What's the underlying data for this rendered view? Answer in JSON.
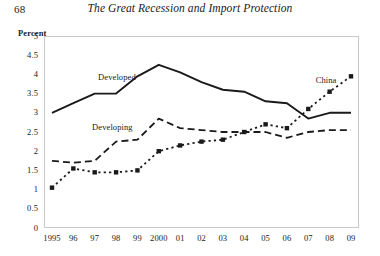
{
  "running_head": {
    "page_number": "68",
    "book_title": "The Great Recession and Import Protection"
  },
  "labels": {
    "developed": "Developed",
    "developing": "Developing",
    "china": "China"
  },
  "chart_data": {
    "type": "line",
    "title": "",
    "xlabel": "",
    "ylabel": "Percent",
    "ylim": [
      0,
      5
    ],
    "ytick_labels": [
      "5",
      "4.5",
      "4",
      "3.5",
      "3",
      "2.5",
      "2",
      "1.5",
      "1",
      "0.5",
      "0"
    ],
    "ytick_values": [
      5,
      4.5,
      4,
      3.5,
      3,
      2.5,
      2,
      1.5,
      1,
      0.5,
      0
    ],
    "grid": false,
    "legend_position": "inline-annotations",
    "categories": [
      "1995",
      "96",
      "97",
      "98",
      "99",
      "2000",
      "01",
      "02",
      "03",
      "04",
      "05",
      "06",
      "07",
      "08",
      "09"
    ],
    "x_values": [
      1995,
      1996,
      1997,
      1998,
      1999,
      2000,
      2001,
      2002,
      2003,
      2004,
      2005,
      2006,
      2007,
      2008,
      2009
    ],
    "series": [
      {
        "name": "Developed",
        "style": "solid",
        "color": "#1a1a1a",
        "markers": false,
        "values": [
          3.0,
          3.25,
          3.5,
          3.5,
          3.95,
          4.25,
          4.05,
          3.8,
          3.6,
          3.55,
          3.3,
          3.25,
          2.85,
          3.0,
          3.0
        ]
      },
      {
        "name": "Developing",
        "style": "dashed",
        "color": "#1a1a1a",
        "markers": false,
        "values": [
          1.75,
          1.7,
          1.75,
          2.25,
          2.3,
          2.85,
          2.6,
          2.55,
          2.5,
          2.5,
          2.5,
          2.35,
          2.5,
          2.55,
          2.55
        ]
      },
      {
        "name": "China",
        "style": "dotted",
        "color": "#1a1a1a",
        "markers": true,
        "values": [
          1.05,
          1.55,
          1.45,
          1.45,
          1.5,
          2.0,
          2.15,
          2.25,
          2.3,
          2.5,
          2.7,
          2.6,
          3.1,
          3.55,
          3.95
        ]
      }
    ]
  }
}
